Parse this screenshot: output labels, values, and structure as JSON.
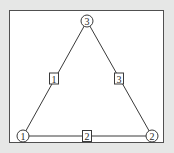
{
  "diagram": {
    "type": "graph",
    "background_color": "#e6e7e6",
    "frame_color": "#505050",
    "nodes": [
      {
        "id": "1",
        "label": "1",
        "x": 23,
        "y": 136
      },
      {
        "id": "2",
        "label": "2",
        "x": 152,
        "y": 136
      },
      {
        "id": "3",
        "label": "3",
        "x": 87,
        "y": 21
      }
    ],
    "edges": [
      {
        "id": "e1",
        "label": "1",
        "from": "1",
        "to": "3",
        "label_x": 54,
        "label_y": 79
      },
      {
        "id": "e2",
        "label": "2",
        "from": "1",
        "to": "2",
        "label_x": 87,
        "label_y": 136
      },
      {
        "id": "e3",
        "label": "3",
        "from": "3",
        "to": "2",
        "label_x": 119,
        "label_y": 79
      }
    ]
  }
}
